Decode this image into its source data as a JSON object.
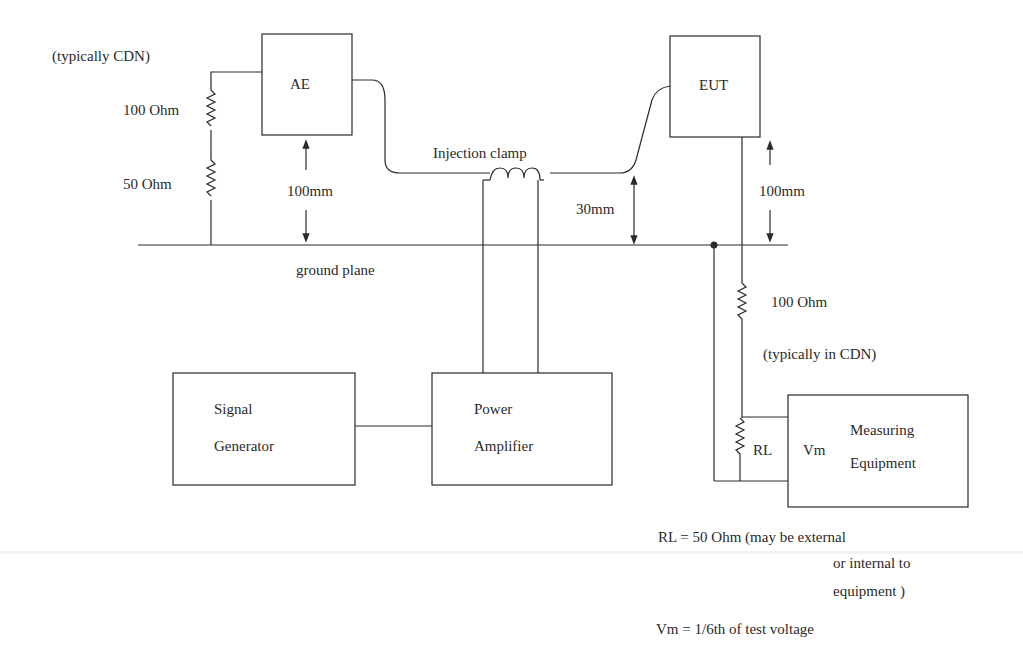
{
  "diagram": {
    "blocks": {
      "ae": "AE",
      "eut": "EUT",
      "signal_generator": [
        "Signal",
        "Generator"
      ],
      "power_amplifier": [
        "Power",
        "Amplifier"
      ],
      "measuring_equipment": [
        "Measuring",
        "Equipment"
      ]
    },
    "labels": {
      "typically_cdn_left": "(typically CDN)",
      "r100_left": "100 Ohm",
      "r50_left": "50 Ohm",
      "ae_height": "100mm",
      "injection_clamp": "Injection clamp",
      "cable_height": "30mm",
      "eut_height": "100mm",
      "ground_plane": "ground plane",
      "r100_right": "100 Ohm",
      "typically_in_cdn": "(typically in CDN)",
      "rl": "RL",
      "vm": "Vm"
    },
    "notes": {
      "rl_note_line1": "RL = 50 Ohm (may be external",
      "rl_note_line2": "or internal to",
      "rl_note_line3": "equipment )",
      "vm_note": "Vm = 1/6th of test voltage"
    },
    "colors": {
      "line": "#2a2a2a",
      "background": "#ffffff"
    }
  }
}
